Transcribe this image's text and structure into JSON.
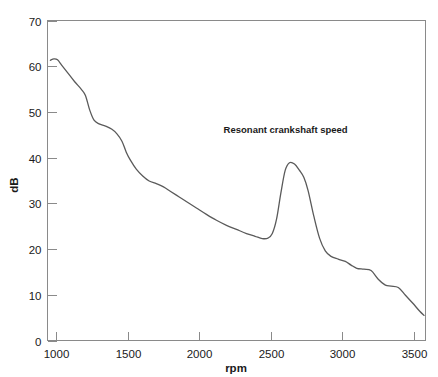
{
  "chart_data": {
    "type": "line",
    "title": "",
    "xlabel": "rpm",
    "ylabel": "dB",
    "xlim": [
      940,
      3580
    ],
    "ylim": [
      0,
      70
    ],
    "grid": false,
    "legend": null,
    "xticks": [
      1000,
      1500,
      2000,
      2500,
      3000,
      3500
    ],
    "xticklabels": [
      "1000",
      "1500",
      "2000",
      "2500",
      "3000",
      "3500"
    ],
    "yticks": [
      0,
      10,
      20,
      30,
      40,
      50,
      60,
      70
    ],
    "yticklabels": [
      "0",
      "10",
      "20",
      "30",
      "40",
      "50",
      "60",
      "70"
    ],
    "annotations": [
      {
        "text": "Resonant crankshaft speed",
        "x": 2170,
        "y": 45.5
      }
    ],
    "series": [
      {
        "name": "noise-level",
        "color": "#5a5a5a",
        "x": [
          960,
          985,
          1010,
          1040,
          1080,
          1130,
          1175,
          1205,
          1235,
          1265,
          1300,
          1345,
          1390,
          1425,
          1460,
          1490,
          1520,
          1560,
          1605,
          1650,
          1700,
          1750,
          1800,
          1860,
          1920,
          1980,
          2050,
          2120,
          2190,
          2260,
          2330,
          2390,
          2440,
          2480,
          2510,
          2540,
          2570,
          2600,
          2630,
          2665,
          2700,
          2730,
          2760,
          2800,
          2840,
          2880,
          2920,
          2970,
          3020,
          3060,
          3100,
          3150,
          3200,
          3250,
          3300,
          3340,
          3390,
          3440,
          3490,
          3540,
          3570
        ],
        "y": [
          61.3,
          61.6,
          61.4,
          60.2,
          58.6,
          56.6,
          55.0,
          53.6,
          50.4,
          48.2,
          47.4,
          46.9,
          46.2,
          45.2,
          43.6,
          41.2,
          39.4,
          37.5,
          36.0,
          34.9,
          34.3,
          33.6,
          32.6,
          31.4,
          30.2,
          29.0,
          27.6,
          26.3,
          25.2,
          24.3,
          23.4,
          22.8,
          22.3,
          22.4,
          23.4,
          26.6,
          32.3,
          37.2,
          38.9,
          38.6,
          37.2,
          35.7,
          32.8,
          27.2,
          22.4,
          19.6,
          18.4,
          17.8,
          17.3,
          16.5,
          15.8,
          15.6,
          15.3,
          13.4,
          12.1,
          11.9,
          11.6,
          9.9,
          8.2,
          6.4,
          5.5
        ]
      }
    ]
  },
  "axis": {
    "x_title": "rpm",
    "y_title": "dB"
  }
}
